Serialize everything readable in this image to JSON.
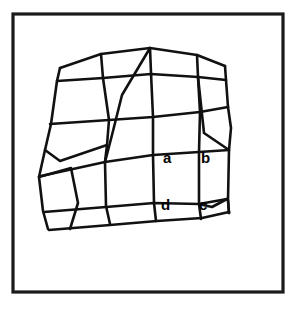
{
  "figure": {
    "background_color": "#ffffff",
    "ink_color": "#111111",
    "frame": {
      "name": "outer-border",
      "x": 13,
      "y": 14,
      "width": 270,
      "height": 278,
      "stroke_width": 3.2
    }
  },
  "labels": [
    {
      "id": "a",
      "text": "a",
      "x": 163,
      "y": 163,
      "corner": "top-left"
    },
    {
      "id": "b",
      "text": "b",
      "x": 201,
      "y": 163,
      "corner": "top-right"
    },
    {
      "id": "c",
      "text": "c",
      "x": 199,
      "y": 210,
      "corner": "bottom-right"
    },
    {
      "id": "d",
      "text": "d",
      "x": 161,
      "y": 210,
      "corner": "bottom-left"
    }
  ],
  "chart_data": {
    "type": "mesh",
    "grid_rows": 5,
    "grid_cols": 4,
    "labelled_cell": {
      "nodes": [
        "a",
        "b",
        "c",
        "d"
      ],
      "order": "counter-clockwise from top-left"
    },
    "nodes": [
      [
        [
          60,
          68
        ],
        [
          101,
          54
        ],
        [
          150,
          48
        ],
        [
          197,
          55
        ],
        [
          225,
          66
        ]
      ],
      [
        [
          57,
          81
        ],
        [
          103,
          78
        ],
        [
          151,
          73
        ],
        [
          198,
          77
        ],
        [
          226,
          80
        ]
      ],
      [
        [
          51,
          124
        ],
        [
          109,
          120
        ],
        [
          153,
          117
        ],
        [
          200,
          112
        ],
        [
          228,
          107
        ]
      ],
      [
        [
          45,
          150
        ],
        [
          107,
          145
        ],
        [
          152,
          140
        ],
        [
          204,
          133
        ],
        [
          231,
          128
        ]
      ],
      [
        [
          39,
          177
        ],
        [
          105,
          162
        ],
        [
          153,
          155
        ],
        [
          199,
          152
        ],
        [
          229,
          150
        ]
      ],
      [
        [
          43,
          211
        ],
        [
          106,
          206
        ],
        [
          154,
          203
        ],
        [
          199,
          204
        ],
        [
          228,
          200
        ]
      ],
      [
        [
          48,
          229
        ],
        [
          110,
          224
        ],
        [
          156,
          221
        ],
        [
          201,
          219
        ],
        [
          229,
          213
        ]
      ]
    ],
    "polylines": [
      {
        "name": "mesh-top-boundary",
        "points": "60,68 101,54 150,48 197,55 225,66"
      },
      {
        "name": "mesh-row-1",
        "points": "57,81 103,78 151,74 198,77 226,80"
      },
      {
        "name": "mesh-row-2",
        "points": "50,124 109,120 153,117 200,112 228,107"
      },
      {
        "name": "mesh-row-3",
        "points": "41,176 105,162 153,155 199,152 229,150"
      },
      {
        "name": "mesh-row-4",
        "points": "44,212 106,207 154,203 199,204 227,199"
      },
      {
        "name": "mesh-bottom-boundary",
        "points": "49,230 110,225 157,221 202,218 229,212"
      },
      {
        "name": "mesh-left-boundary",
        "points": "60,68 57,81 51,124 45,150 39,177 43,211 48,229"
      },
      {
        "name": "mesh-right-boundary",
        "points": "225,66 226,80 228,107 231,128 229,150 228,200 229,213"
      },
      {
        "name": "mesh-col-1",
        "points": "101,54 103,78 109,120 107,145 105,162 106,206 110,224"
      },
      {
        "name": "mesh-col-2-diagonal",
        "points": "150,48 122,95 112,135 105,162"
      },
      {
        "name": "mesh-col-3",
        "points": "150,48 151,73 153,117 153,155 154,203 156,221"
      },
      {
        "name": "mesh-col-4",
        "points": "197,55 198,77 200,112 199,152 199,204 201,219"
      },
      {
        "name": "mesh-inner-diagonal-right",
        "points": "198,77 204,133 229,150"
      },
      {
        "name": "mesh-inner-left-short",
        "points": "45,150 60,161 107,145"
      },
      {
        "name": "mesh-inner-left-lower",
        "points": "39,177 71,168 78,203 70,229"
      },
      {
        "name": "mesh-inner-right-lower",
        "points": "199,204 212,207 227,199"
      },
      {
        "name": "mesh-inner-right-corner",
        "points": "228,200 229,213"
      }
    ]
  }
}
